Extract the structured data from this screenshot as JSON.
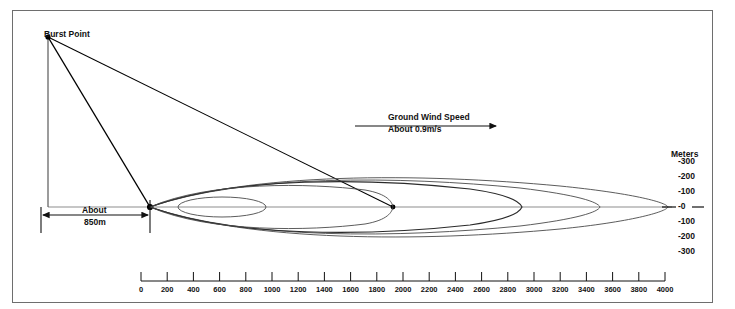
{
  "diagram": {
    "title_labels": {
      "burst_point": "Burst Point",
      "meters_axis_header": "Meters"
    },
    "wind_annotation": {
      "line1": "Ground Wind Speed",
      "line2": "About 0.9m/s",
      "arrow_direction": "right",
      "arrow_icon": "arrow-right-icon"
    },
    "dimension_annotation": {
      "line1": "About",
      "line2": "850m",
      "arrow_icon": "double-arrow-horizontal-icon"
    },
    "vertical_axis": {
      "unit_label": "Meters",
      "ticks": [
        "-300",
        "-200",
        "-100",
        "-0",
        "-100",
        "-200",
        "-300"
      ],
      "center_index": 3
    },
    "horizontal_scale": {
      "ticks": [
        "0",
        "200",
        "400",
        "600",
        "800",
        "1000",
        "1200",
        "1400",
        "1600",
        "1800",
        "2000",
        "2200",
        "2400",
        "2600",
        "2800",
        "3000",
        "3200",
        "3400",
        "3600",
        "3800",
        "4000"
      ],
      "unit": "m",
      "min": 0,
      "max": 4000,
      "step": 200
    },
    "colors": {
      "frame": "#6e6e6e",
      "contour_stroke": "#4a4a4a",
      "contour_dark": "#2a2a2a",
      "axis_line": "#8d8d8d",
      "ray_line": "#000000",
      "text": "#111111",
      "background": "#ffffff"
    },
    "geometry": {
      "burst_point": {
        "x": 48,
        "y": 37
      },
      "ground_origin": {
        "x": 48,
        "y": 207
      },
      "contour_apex": {
        "x": 150,
        "y": 207
      },
      "ray_terminus": {
        "x": 393,
        "y": 207
      },
      "baseline_y": 207,
      "scale_left_x": 141,
      "scale_right_x": 665
    },
    "contours": [
      {
        "name": "contour-innermost",
        "tip_x": 178,
        "far_x": 267,
        "half_height": 10
      },
      {
        "name": "contour-inner",
        "tip_x": 150,
        "far_x": 393,
        "half_height": 24
      },
      {
        "name": "contour-mid",
        "tip_x": 150,
        "far_x": 522,
        "half_height": 30
      },
      {
        "name": "contour-outer",
        "tip_x": 150,
        "far_x": 600,
        "half_height": 33
      },
      {
        "name": "contour-outermost",
        "tip_x": 150,
        "far_x": 668,
        "half_height": 34
      }
    ]
  }
}
